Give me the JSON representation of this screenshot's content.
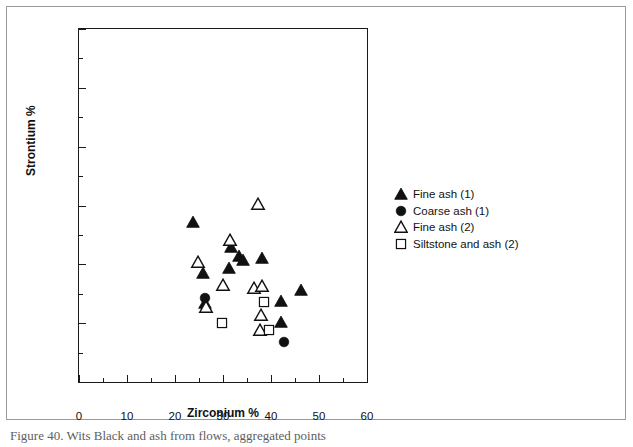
{
  "chart_data": {
    "type": "scatter",
    "title": "",
    "xlabel": "Zirconium %",
    "ylabel": "Strontium %",
    "xlim": [
      0,
      60
    ],
    "ylim": [
      0,
      60
    ],
    "xticks": [
      0,
      10,
      20,
      30,
      40,
      50,
      60
    ],
    "yticks": [
      0,
      10,
      20,
      30,
      40,
      50,
      60
    ],
    "xminor_ticks": [
      5,
      15,
      25,
      35,
      45,
      55
    ],
    "yminor_ticks": [
      5,
      15,
      25,
      35,
      45,
      55
    ],
    "grid": false,
    "legend_position": "right",
    "series": [
      {
        "name": "Fine ash (1)",
        "marker": "filled-triangle",
        "color": "#111111",
        "points": [
          {
            "x": 23.8,
            "y": 27.2
          },
          {
            "x": 25.8,
            "y": 18.6
          },
          {
            "x": 26.3,
            "y": 13.5
          },
          {
            "x": 31.3,
            "y": 19.3
          },
          {
            "x": 31.6,
            "y": 22.9
          },
          {
            "x": 33.3,
            "y": 21.4
          },
          {
            "x": 34.2,
            "y": 20.7
          },
          {
            "x": 38.2,
            "y": 21.0
          },
          {
            "x": 42.0,
            "y": 13.7
          },
          {
            "x": 42.1,
            "y": 10.2
          },
          {
            "x": 46.3,
            "y": 15.7
          }
        ]
      },
      {
        "name": "Coarse ash (1)",
        "marker": "filled-circle",
        "color": "#111111",
        "points": [
          {
            "x": 26.2,
            "y": 14.3
          },
          {
            "x": 42.8,
            "y": 6.8
          }
        ]
      },
      {
        "name": "Fine ash (2)",
        "marker": "open-triangle",
        "color": "#111111",
        "points": [
          {
            "x": 24.7,
            "y": 20.4
          },
          {
            "x": 26.4,
            "y": 12.8
          },
          {
            "x": 29.9,
            "y": 16.5
          },
          {
            "x": 31.4,
            "y": 24.2
          },
          {
            "x": 36.5,
            "y": 16.0
          },
          {
            "x": 37.2,
            "y": 30.3
          },
          {
            "x": 38.2,
            "y": 16.4
          },
          {
            "x": 38.0,
            "y": 11.4
          },
          {
            "x": 37.7,
            "y": 8.8
          }
        ]
      },
      {
        "name": "Siltstone and ash (2)",
        "marker": "open-square",
        "color": "#111111",
        "points": [
          {
            "x": 29.7,
            "y": 10.0
          },
          {
            "x": 38.5,
            "y": 13.6
          },
          {
            "x": 39.5,
            "y": 8.8
          }
        ]
      }
    ]
  },
  "legend": {
    "items": [
      {
        "label": "Fine ash (1)",
        "marker": "filled-triangle"
      },
      {
        "label": "Coarse ash (1)",
        "marker": "filled-circle"
      },
      {
        "label": "Fine ash (2)",
        "marker": "open-triangle"
      },
      {
        "label": "Siltstone and ash (2)",
        "marker": "open-square"
      }
    ]
  },
  "caption": {
    "text": "Figure 40. Wits Black and ash from flows, aggregated points"
  }
}
